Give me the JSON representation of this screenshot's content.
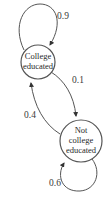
{
  "diagram": {
    "type": "markov-chain-state-diagram",
    "colors": {
      "stroke": "#555555",
      "text": "#2a2a2a",
      "background": "#ffffff"
    },
    "states": [
      {
        "id": "college",
        "lines": [
          "College",
          "educated"
        ]
      },
      {
        "id": "not_college",
        "lines": [
          "Not",
          "college",
          "educated"
        ]
      }
    ],
    "transitions": [
      {
        "from": "college",
        "to": "college",
        "label": "0.9"
      },
      {
        "from": "college",
        "to": "not_college",
        "label": "0.1"
      },
      {
        "from": "not_college",
        "to": "college",
        "label": "0.4"
      },
      {
        "from": "not_college",
        "to": "not_college",
        "label": "0.6"
      }
    ]
  }
}
